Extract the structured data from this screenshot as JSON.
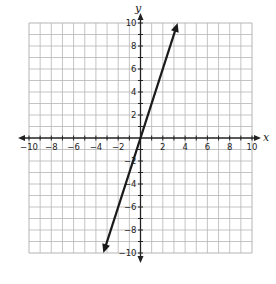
{
  "chart_data": {
    "type": "line",
    "title": "",
    "xlabel": "x",
    "ylabel": "y",
    "xlim": [
      -10,
      10
    ],
    "ylim": [
      -10,
      10
    ],
    "grid": true,
    "grid_step": 1,
    "x_tick_labels": [
      "-10",
      "-8",
      "-6",
      "-4",
      "-2",
      "2",
      "4",
      "6",
      "8",
      "10"
    ],
    "x_tick_values": [
      -10,
      -8,
      -6,
      -4,
      -2,
      2,
      4,
      6,
      8,
      10
    ],
    "y_tick_labels": [
      "10",
      "8",
      "6",
      "4",
      "2",
      "-2",
      "-4",
      "-6",
      "-8",
      "-10"
    ],
    "y_tick_values": [
      10,
      8,
      6,
      4,
      2,
      -2,
      -4,
      -6,
      -8,
      -10
    ],
    "series": [
      {
        "name": "y = 3x",
        "equation": "y = 3x",
        "slope": 3,
        "intercept": 0,
        "x": [
          -3.33,
          0,
          3.33
        ],
        "y": [
          -10,
          0,
          10
        ],
        "arrows_both_ends": true,
        "color": "#1a1a1a"
      }
    ],
    "colors": {
      "grid": "#b5b5b5",
      "axes": "#222222",
      "background": "#ffffff"
    }
  }
}
